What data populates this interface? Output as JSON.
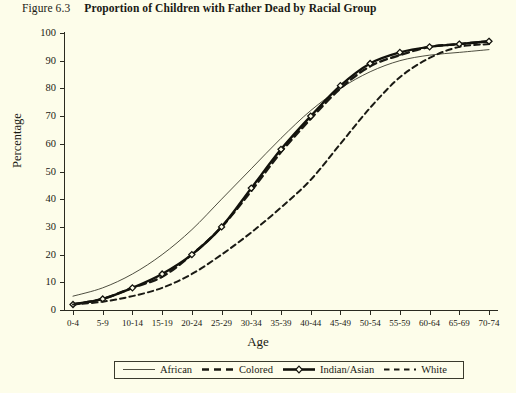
{
  "figure": {
    "number": "Figure 6.3",
    "title": "Proportion of Children with Father Dead by Racial Group"
  },
  "colors": {
    "background": "#fdfdea",
    "ink": "#2a2a20",
    "african": "#3a3a2c",
    "colored": "#1a1a14",
    "indian_asian": "#12120c",
    "white": "#1a1a14"
  },
  "chart_data": {
    "type": "line",
    "title": "Proportion of Children with Father Dead by Racial Group",
    "xlabel": "Age",
    "ylabel": "Percentage",
    "ylim": [
      0,
      100
    ],
    "yticks": [
      0,
      10,
      20,
      30,
      40,
      50,
      60,
      70,
      80,
      90,
      100
    ],
    "grid": false,
    "legend_position": "bottom",
    "categories": [
      "0-4",
      "5-9",
      "10-14",
      "15-19",
      "20-24",
      "25-29",
      "30-34",
      "35-39",
      "40-44",
      "45-49",
      "50-54",
      "55-59",
      "60-64",
      "65-69",
      "70-74"
    ],
    "series": [
      {
        "name": "African",
        "style": "thin-solid",
        "marker": "none",
        "values": [
          5,
          8,
          13,
          20,
          29,
          40,
          51,
          62,
          72,
          80,
          86,
          90,
          92,
          93,
          94
        ]
      },
      {
        "name": "Colored",
        "style": "thick-dashed",
        "marker": "none",
        "values": [
          2,
          4,
          8,
          12,
          20,
          30,
          43,
          57,
          69,
          80,
          88,
          92,
          95,
          96,
          97
        ]
      },
      {
        "name": "Indian/Asian",
        "style": "thick-solid",
        "marker": "diamond",
        "values": [
          2,
          4,
          8,
          13,
          20,
          30,
          44,
          58,
          70,
          81,
          89,
          93,
          95,
          96,
          97
        ]
      },
      {
        "name": "White",
        "style": "dashed",
        "marker": "none",
        "values": [
          2,
          3,
          5,
          8,
          13,
          20,
          28,
          37,
          47,
          60,
          73,
          84,
          91,
          95,
          96
        ]
      }
    ]
  },
  "legend": {
    "items": [
      {
        "label": "African",
        "swatch": "thin-solid-line-icon"
      },
      {
        "label": "Colored",
        "swatch": "thick-dashed-line-icon"
      },
      {
        "label": "Indian/Asian",
        "swatch": "thick-solid-diamond-line-icon"
      },
      {
        "label": "White",
        "swatch": "dashed-line-icon"
      }
    ]
  }
}
